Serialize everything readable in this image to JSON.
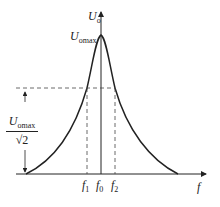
{
  "diagram": {
    "axes": {
      "x_label": "f",
      "y_label_main": "U",
      "y_label_sub": "o"
    },
    "peak_label": {
      "main": "U",
      "sub": "omax"
    },
    "half_power_label": {
      "num_main": "U",
      "num_sub": "omax",
      "den": "√2"
    },
    "x_ticks": [
      {
        "main": "f",
        "sub": "1"
      },
      {
        "main": "f",
        "sub": "0"
      },
      {
        "main": "f",
        "sub": "2"
      }
    ],
    "colors": {
      "line": "#222222",
      "dash": "#444444"
    }
  }
}
